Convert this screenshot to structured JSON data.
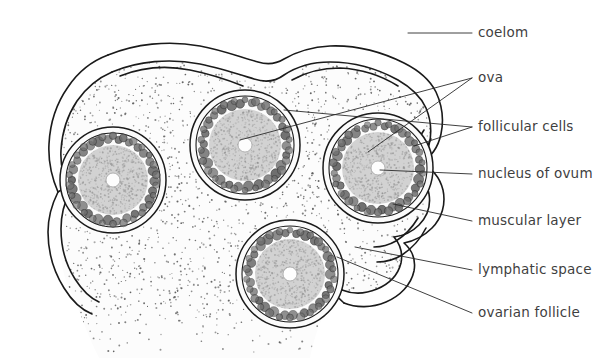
{
  "figure": {
    "width": 616,
    "height": 358,
    "background_color": "#ffffff",
    "ink_color": "#1a1a1a",
    "text_color": "#3f3f3f",
    "ovum_fill": "#d2d2d2",
    "follicular_cell_fill": "#6e6e6e",
    "stroma_fill": "#fcfcfc"
  },
  "labels": [
    {
      "id": "coelom",
      "text": "coelom",
      "x": 478,
      "y": 33,
      "leaders": [
        [
          [
            408,
            33
          ],
          [
            472,
            33
          ]
        ]
      ]
    },
    {
      "id": "ova",
      "text": "ova",
      "x": 478,
      "y": 78,
      "leaders": [
        [
          [
            472,
            78
          ],
          [
            240,
            140
          ]
        ],
        [
          [
            472,
            78
          ],
          [
            368,
            152
          ]
        ]
      ]
    },
    {
      "id": "follicular-cells",
      "text": "follicular cells",
      "x": 478,
      "y": 127,
      "leaders": [
        [
          [
            472,
            127
          ],
          [
            284,
            110
          ]
        ],
        [
          [
            472,
            127
          ],
          [
            414,
            146
          ]
        ]
      ]
    },
    {
      "id": "nucleus-of-ovum",
      "text": "nucleus of ovum",
      "x": 478,
      "y": 174,
      "leaders": [
        [
          [
            472,
            174
          ],
          [
            380,
            170
          ]
        ]
      ]
    },
    {
      "id": "muscular-layer",
      "text": "muscular layer",
      "x": 478,
      "y": 221,
      "leaders": [
        [
          [
            472,
            221
          ],
          [
            393,
            204
          ]
        ]
      ]
    },
    {
      "id": "lymphatic-space",
      "text": "lymphatic space",
      "x": 478,
      "y": 270,
      "leaders": [
        [
          [
            472,
            270
          ],
          [
            355,
            247
          ]
        ]
      ]
    },
    {
      "id": "ovarian-follicle",
      "text": "ovarian follicle",
      "x": 478,
      "y": 313,
      "leaders": [
        [
          [
            472,
            313
          ],
          [
            337,
            257
          ]
        ]
      ]
    }
  ],
  "follicles": [
    {
      "id": "follicle-left",
      "cx": 113,
      "cy": 180,
      "outer_radius": 53,
      "inner_line_radius": 47,
      "granulosa_ring_radius": 41,
      "ovum_radius": 35,
      "nucleus_radius": 7,
      "granulosa_cell_count": 26
    },
    {
      "id": "follicle-middle",
      "cx": 245,
      "cy": 145,
      "outer_radius": 55,
      "inner_line_radius": 49,
      "granulosa_ring_radius": 42,
      "ovum_radius": 36,
      "nucleus_radius": 7,
      "granulosa_cell_count": 26
    },
    {
      "id": "follicle-right",
      "cx": 378,
      "cy": 168,
      "outer_radius": 55,
      "inner_line_radius": 49,
      "granulosa_ring_radius": 42,
      "ovum_radius": 36,
      "nucleus_radius": 7,
      "granulosa_cell_count": 26
    },
    {
      "id": "follicle-bottom",
      "cx": 290,
      "cy": 274,
      "outer_radius": 54,
      "inner_line_radius": 48,
      "granulosa_ring_radius": 41,
      "ovum_radius": 35,
      "nucleus_radius": 7,
      "granulosa_cell_count": 26
    }
  ],
  "outlines": {
    "muscular_outer": "M 108 55 C 135 44 168 40 200 46 C 222 50 240 57 258 62 C 268 65 276 64 284 59 C 296 52 312 47 330 46 C 356 45 382 52 404 63 C 420 71 430 80 436 92 C 442 105 444 120 441 134 C 438 148 430 158 420 163 C 432 168 440 178 443 190 C 446 204 442 218 432 228 C 424 236 414 241 404 243 C 412 250 416 260 414 271 C 411 285 400 296 386 302 C 372 308 356 308 344 303",
    "muscular_inner": "M 112 72 C 138 61 170 58 200 64 C 220 68 238 74 254 79 C 266 83 276 81 284 75 C 296 67 312 62 330 62 C 354 62 378 69 398 80 C 412 88 421 97 426 108 C 431 120 432 133 429 145 C 426 156 419 164 410 168 C 420 174 427 183 429 194 C 431 206 427 217 419 225 C 412 232 403 236 394 237 C 400 244 403 253 401 263 C 398 275 389 284 377 289 C 365 294 352 294 342 290",
    "left_wall_outer": "M 108 55 C 92 61 78 72 68 87 C 56 104 50 124 49 144 C 48 162 52 178 58 192 C 52 204 48 218 48 232 C 48 252 54 272 64 288 C 72 301 82 310 92 314",
    "left_wall_inner": "M 112 72 C 98 78 86 88 77 101 C 67 116 62 133 61 150 C 60 166 64 180 70 192 C 64 203 61 216 61 229 C 61 247 66 265 75 279 C 82 290 90 298 99 302",
    "notch_upper": "M 58 192 C 66 186 76 183 86 183 C 96 183 104 186 110 191",
    "notch_lower": "M 70 192 C 78 188 88 186 97 187 C 105 188 112 191 117 195",
    "top_fold_left": "M 120 76 C 140 68 165 65 190 70 C 210 74 228 80 243 86",
    "top_fold_right": "M 292 80 C 306 72 322 68 340 68 C 362 69 382 76 398 86",
    "right_fold_a": "M 424 130 C 418 140 412 150 405 157 C 399 163 392 167 386 168",
    "right_fold_b": "M 431 139 C 425 151 418 162 410 170 C 404 176 397 180 390 181",
    "right_fold_c": "M 418 218 C 412 228 404 236 396 241 C 389 245 381 247 374 247",
    "right_fold_d": "M 426 228 C 420 240 411 249 402 255 C 394 260 385 262 377 262",
    "bottom_notch": "M 344 303 C 336 296 329 288 324 280",
    "bottom_notch_2": "M 342 290 C 334 284 327 277 322 270"
  },
  "stipple": {
    "description": "fine dotted stroma fill",
    "dot_color": "#5a5a5a",
    "density": 2600
  }
}
